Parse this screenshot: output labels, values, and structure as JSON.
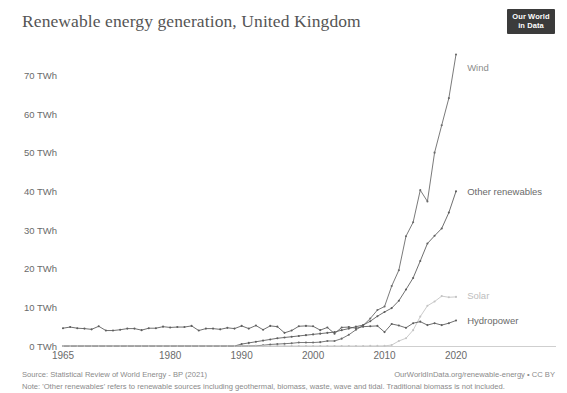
{
  "header": {
    "title": "Renewable energy generation, United Kingdom",
    "logo_line1": "Our World",
    "logo_line2": "in Data"
  },
  "footer": {
    "source": "Source: Statistical Review of World Energy - BP (2021)",
    "url": "OurWorldInData.org/renewable-energy • CC BY",
    "note": "Note: 'Other renewables' refers to renewable sources including geothermal, biomass, waste, wave and tidal. Traditional biomass is not included."
  },
  "chart_data": {
    "type": "line",
    "title": "Renewable energy generation, United Kingdom",
    "xlabel": "",
    "ylabel": "",
    "xlim": [
      1965,
      2020
    ],
    "ylim": [
      0,
      75
    ],
    "grid": false,
    "legend_position": "right-inline",
    "y_ticks": [
      0,
      10,
      20,
      30,
      40,
      50,
      60,
      70
    ],
    "y_tick_labels": [
      "0 TWh",
      "10 TWh",
      "20 TWh",
      "30 TWh",
      "40 TWh",
      "50 TWh",
      "60 TWh",
      "70 TWh"
    ],
    "x_ticks": [
      1965,
      1980,
      1990,
      2000,
      2010,
      2020
    ],
    "x_tick_labels": [
      "1965",
      "1980",
      "1990",
      "2000",
      "2010",
      "2020"
    ],
    "x": [
      1965,
      1966,
      1967,
      1968,
      1969,
      1970,
      1971,
      1972,
      1973,
      1974,
      1975,
      1976,
      1977,
      1978,
      1979,
      1980,
      1981,
      1982,
      1983,
      1984,
      1985,
      1986,
      1987,
      1988,
      1989,
      1990,
      1991,
      1992,
      1993,
      1994,
      1995,
      1996,
      1997,
      1998,
      1999,
      2000,
      2001,
      2002,
      2003,
      2004,
      2005,
      2006,
      2007,
      2008,
      2009,
      2010,
      2011,
      2012,
      2013,
      2014,
      2015,
      2016,
      2017,
      2018,
      2019,
      2020
    ],
    "series": [
      {
        "name": "Wind",
        "color": "#6b6b6b",
        "label_color": "#8c8c8c",
        "values": [
          0,
          0,
          0,
          0,
          0,
          0,
          0,
          0,
          0,
          0,
          0,
          0,
          0,
          0,
          0,
          0,
          0,
          0,
          0,
          0,
          0,
          0,
          0,
          0,
          0,
          0.01,
          0.03,
          0.06,
          0.2,
          0.4,
          0.5,
          0.6,
          0.7,
          0.9,
          0.9,
          0.9,
          1.0,
          1.3,
          1.3,
          1.9,
          2.9,
          4.2,
          5.3,
          7.1,
          9.3,
          10.2,
          15.5,
          19.6,
          28.4,
          32.0,
          40.3,
          37.4,
          50.0,
          57.1,
          64.1,
          75.4
        ]
      },
      {
        "name": "Other renewables",
        "color": "#5f5f5f",
        "label_color": "#6a6a6a",
        "values": [
          0,
          0,
          0,
          0,
          0,
          0,
          0,
          0,
          0,
          0,
          0,
          0,
          0,
          0,
          0,
          0,
          0,
          0,
          0,
          0,
          0,
          0,
          0,
          0,
          0,
          0.5,
          0.8,
          1.1,
          1.4,
          1.7,
          2.0,
          2.2,
          2.4,
          2.6,
          2.8,
          3.0,
          3.2,
          3.4,
          3.6,
          4.1,
          4.5,
          5.0,
          5.4,
          6.4,
          7.7,
          8.8,
          9.8,
          11.7,
          14.6,
          17.6,
          22.0,
          26.5,
          28.5,
          30.4,
          34.5,
          40.0
        ]
      },
      {
        "name": "Solar",
        "color": "#c4c4c4",
        "label_color": "#bdbdbd",
        "values": [
          0,
          0,
          0,
          0,
          0,
          0,
          0,
          0,
          0,
          0,
          0,
          0,
          0,
          0,
          0,
          0,
          0,
          0,
          0,
          0,
          0,
          0,
          0,
          0,
          0,
          0,
          0,
          0,
          0,
          0,
          0,
          0,
          0,
          0,
          0,
          0,
          0,
          0,
          0,
          0,
          0,
          0,
          0,
          0.02,
          0.02,
          0.03,
          0.24,
          1.3,
          2.0,
          4.1,
          7.6,
          10.4,
          11.5,
          12.9,
          12.6,
          12.7
        ]
      },
      {
        "name": "Hydropower",
        "color": "#5f5f5f",
        "label_color": "#6a6a6a",
        "values": [
          4.6,
          4.9,
          4.6,
          4.5,
          4.3,
          5.1,
          4.0,
          4.0,
          4.2,
          4.5,
          4.5,
          4.1,
          4.6,
          4.6,
          5.0,
          4.8,
          4.9,
          4.9,
          5.2,
          4.0,
          4.5,
          4.5,
          4.3,
          4.7,
          4.5,
          5.2,
          4.5,
          5.3,
          4.2,
          5.2,
          5.0,
          3.4,
          4.0,
          5.1,
          5.2,
          5.1,
          4.1,
          4.8,
          3.2,
          4.8,
          4.9,
          4.6,
          5.0,
          5.1,
          5.2,
          3.6,
          5.7,
          5.3,
          4.7,
          5.9,
          6.3,
          5.4,
          5.9,
          5.4,
          5.9,
          6.6
        ]
      }
    ],
    "annotations": [
      {
        "text": "Wind",
        "x": 2021,
        "y": 72
      },
      {
        "text": "Other renewables",
        "x": 2021,
        "y": 40
      },
      {
        "text": "Solar",
        "x": 2021,
        "y": 13
      },
      {
        "text": "Hydropower",
        "x": 2021,
        "y": 6.6
      }
    ]
  }
}
